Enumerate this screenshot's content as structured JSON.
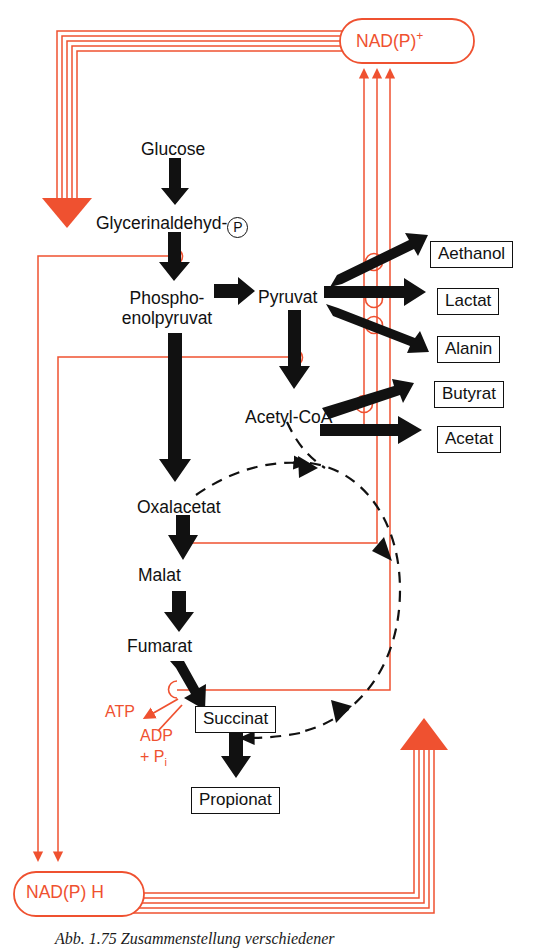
{
  "figure": {
    "caption": "Abb. 1.75  Zusammenstellung verschiedener",
    "colors": {
      "redox_red": "#ef5130",
      "arrow_black": "#111111",
      "background": "#ffffff"
    }
  },
  "cofactors": {
    "oxidized": "NAD(P)",
    "oxidized_charge": "+",
    "reduced": "NAD(P) H",
    "atp": "ATP",
    "adp": "ADP",
    "phosphate_prefix": "+ P",
    "phosphate_sub": "i"
  },
  "metabolites": [
    {
      "id": "glucose",
      "label": "Glucose",
      "x": 141,
      "y": 140,
      "boxed": false
    },
    {
      "id": "g3p",
      "label": "Glycerinaldehyd-",
      "x": 96,
      "y": 214,
      "boxed": false,
      "has_p_circle": true
    },
    {
      "id": "pep",
      "label": "Phospho-\nenolpyruvat",
      "x": 115,
      "y": 289,
      "boxed": false
    },
    {
      "id": "pyruvat",
      "label": "Pyruvat",
      "x": 258,
      "y": 289,
      "boxed": false
    },
    {
      "id": "acetylcoa",
      "label": "Acetyl-CoA",
      "x": 245,
      "y": 408,
      "boxed": false
    },
    {
      "id": "oxalacetat",
      "label": "Oxalacetat",
      "x": 137,
      "y": 499,
      "boxed": false
    },
    {
      "id": "malat",
      "label": "Malat",
      "x": 138,
      "y": 575,
      "boxed": false
    },
    {
      "id": "fumarat",
      "label": "Fumarat",
      "x": 127,
      "y": 646,
      "boxed": false
    }
  ],
  "products": [
    {
      "id": "aethanol",
      "label": "Aethanol",
      "x": 432,
      "y": 243
    },
    {
      "id": "lactat",
      "label": "Lactat",
      "x": 438,
      "y": 292
    },
    {
      "id": "alanin",
      "label": "Alanin",
      "x": 438,
      "y": 340
    },
    {
      "id": "butyrat",
      "label": "Butyrat",
      "x": 435,
      "y": 385
    },
    {
      "id": "acetat",
      "label": "Acetat",
      "x": 438,
      "y": 430
    },
    {
      "id": "succinat",
      "label": "Succinat",
      "x": 197,
      "y": 709
    },
    {
      "id": "propionat",
      "label": "Propionat",
      "x": 193,
      "y": 790
    }
  ],
  "redox_steps": [
    {
      "step": "glycerinaldehyd-p-to-pep",
      "label": "NAD(P)+ reduction hook"
    },
    {
      "step": "pyruvat-to-acetyl-coa",
      "label": "NAD(P)+ reduction hook"
    },
    {
      "step": "oxalacetat-to-malat",
      "label": "NAD(P)H oxidation hook"
    },
    {
      "step": "fumarat-to-succinat",
      "label": "NAD(P)H oxidation hook"
    },
    {
      "step": "pyruvat-to-aethanol",
      "label": "NAD(P)H oxidation hook"
    },
    {
      "step": "pyruvat-to-lactat",
      "label": "NAD(P)H oxidation hook"
    },
    {
      "step": "pyruvat-to-alanin",
      "label": "NAD(P)H oxidation hook"
    },
    {
      "step": "acetyl-coa-to-butyrat",
      "label": "NAD(P)H oxidation hook"
    }
  ]
}
